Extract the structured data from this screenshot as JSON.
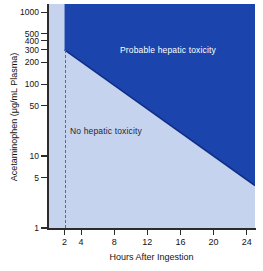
{
  "chart_data": {
    "type": "area",
    "title": "",
    "xlabel": "Hours After Ingestion",
    "ylabel": "Acetaminophen (μg/mL Plasma)",
    "yscale": "log",
    "xlim": [
      0,
      25
    ],
    "ylim": [
      1,
      1300
    ],
    "grid": false,
    "legend_position": "none",
    "x_ticks": [
      2,
      4,
      8,
      12,
      16,
      20,
      24
    ],
    "x_tick_labels": [
      "2",
      "4",
      "8",
      "12",
      "16",
      "20",
      "24"
    ],
    "y_ticks": [
      1,
      5,
      10,
      50,
      100,
      200,
      300,
      400,
      500,
      1000
    ],
    "y_tick_labels": [
      "1",
      "5",
      "10",
      "50",
      "100",
      "200",
      "300",
      "400",
      "500",
      "1000"
    ],
    "series": [
      {
        "name": "treatment line",
        "style": "solid",
        "color": "#1b3f9c",
        "x": [
          2,
          24
        ],
        "values": [
          300,
          4.7
        ]
      },
      {
        "name": "4 hour reference",
        "style": "dashed",
        "color": "#5a6a88",
        "x": [
          2,
          2
        ],
        "values": [
          1,
          300
        ]
      }
    ],
    "regions": [
      {
        "name": "probable-hepatic-toxicity",
        "label": "Probable hepatic toxicity",
        "color": "#1b45ad",
        "text_color": "#ffffff"
      },
      {
        "name": "no-hepatic-toxicity",
        "label": "No hepatic toxicity",
        "color": "#c6d3ee",
        "text_color": "#1c2838"
      }
    ]
  },
  "colors": {
    "toxic_fill": "#1b45ad",
    "safe_fill": "#c6d3ee",
    "axis": "#2b2b2b",
    "dashed_line": "#5a6a88",
    "background": "#ffffff"
  }
}
